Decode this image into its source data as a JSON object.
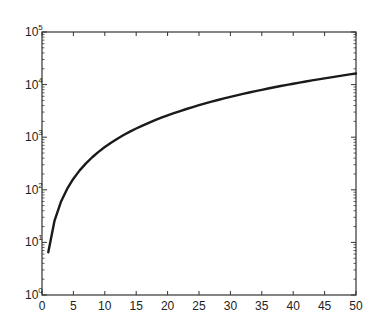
{
  "chart_data": {
    "type": "line",
    "title": "",
    "xlabel": "",
    "ylabel": "",
    "xscale": "linear",
    "yscale": "log",
    "xlim": [
      0,
      50
    ],
    "ylim": [
      1,
      100000
    ],
    "grid": false,
    "legend": null,
    "x_ticks": [
      0,
      5,
      10,
      15,
      20,
      25,
      30,
      35,
      40,
      45,
      50
    ],
    "x_tick_labels": [
      "0",
      "5",
      "10",
      "15",
      "20",
      "25",
      "30",
      "35",
      "40",
      "45",
      "50"
    ],
    "y_ticks": [
      1,
      10,
      100,
      1000,
      10000,
      100000
    ],
    "y_tick_labels": [
      {
        "base": "10",
        "exp": "0"
      },
      {
        "base": "10",
        "exp": "1"
      },
      {
        "base": "10",
        "exp": "2"
      },
      {
        "base": "10",
        "exp": "3"
      },
      {
        "base": "10",
        "exp": "4"
      },
      {
        "base": "10",
        "exp": "5"
      }
    ],
    "series": [
      {
        "name": "curve",
        "color": "#1a1a1a",
        "x": [
          1,
          2,
          3,
          4,
          5,
          6,
          7,
          8,
          9,
          10,
          11,
          12,
          13,
          14,
          15,
          16,
          17,
          18,
          19,
          20,
          21,
          22,
          23,
          24,
          25,
          26,
          27,
          28,
          29,
          30,
          31,
          32,
          33,
          34,
          35,
          36,
          37,
          38,
          39,
          40,
          41,
          42,
          43,
          44,
          45,
          46,
          47,
          48,
          49,
          50
        ],
        "values": [
          6.5,
          26,
          58.5,
          104,
          162.5,
          234,
          318.5,
          416,
          526.5,
          650,
          786.5,
          936,
          1098.5,
          1274,
          1462.5,
          1664,
          1878.5,
          2106,
          2346.5,
          2600,
          2866.5,
          3146,
          3438.5,
          3744,
          4062.5,
          4394,
          4738.5,
          5096,
          5466.5,
          5850,
          6246.5,
          6656,
          7078.5,
          7514,
          7962.5,
          8424,
          8898.5,
          9386,
          9886.5,
          10400,
          10926.5,
          11466,
          12018.5,
          12584,
          13162.5,
          13754,
          14358.5,
          14976,
          15606.5,
          16250
        ]
      }
    ]
  },
  "colors": {
    "axis": "#333333",
    "line": "#1a1a1a",
    "background": "#ffffff"
  }
}
